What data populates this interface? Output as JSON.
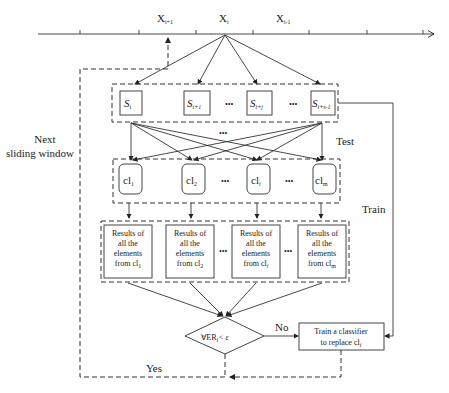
{
  "timeline": {
    "labels": [
      {
        "main": "X",
        "sub": "i+1"
      },
      {
        "main": "X",
        "sub": "i"
      },
      {
        "main": "X",
        "sub": "i-1"
      }
    ]
  },
  "samples": [
    {
      "main": "S",
      "sub": "i"
    },
    {
      "main": "S",
      "sub": "i+1"
    },
    {
      "main": "S",
      "sub": "i+j"
    },
    {
      "main": "S",
      "sub": "i+s-1"
    }
  ],
  "classifiers": [
    {
      "main": "cl",
      "sub": "1"
    },
    {
      "main": "cl",
      "sub": "2"
    },
    {
      "main": "cl",
      "sub": "i"
    },
    {
      "main": "cl",
      "sub": "m"
    }
  ],
  "results": [
    {
      "line1": "Results of",
      "line2": "all the",
      "line3": "elements",
      "line4": "from cl",
      "sub": "1"
    },
    {
      "line1": "Results of",
      "line2": "all the",
      "line3": "elements",
      "line4": "from cl",
      "sub": "2"
    },
    {
      "line1": "Results of",
      "line2": "all the",
      "line3": "elements",
      "line4": "from cl",
      "sub": "i"
    },
    {
      "line1": "Results of",
      "line2": "all the",
      "line3": "elements",
      "line4": "from cl",
      "sub": "m"
    }
  ],
  "ellipsis": "•••",
  "decision": {
    "text": "∀ER",
    "sub": "i",
    "rest": "< ε"
  },
  "train_box": {
    "line1": "Train a classifier",
    "line2": "to replace cl",
    "sub": "i"
  },
  "edge_labels": {
    "test": "Test",
    "train": "Train",
    "no": "No",
    "yes": "Yes",
    "next_line1": "Next",
    "next_line2": "sliding window"
  }
}
